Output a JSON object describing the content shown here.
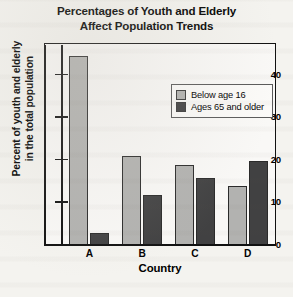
{
  "chart_data": {
    "type": "bar",
    "title": "Percentages of Youth and Elderly Affect Population Trends",
    "title_lines": [
      "Percentages of Youth and Elderly",
      "Affect Population Trends"
    ],
    "xlabel": "Country",
    "ylabel": "Percent of youth and elderly in the total population",
    "ylabel_lines": [
      "Percent of youth and elderly",
      "in the total population"
    ],
    "categories": [
      "A",
      "B",
      "C",
      "D"
    ],
    "ylim": [
      0,
      47
    ],
    "yticks": [
      0,
      10,
      20,
      30,
      40
    ],
    "ytick_labels": [
      "0",
      "10",
      "20",
      "30",
      "40"
    ],
    "grid": false,
    "legend_position": "upper right",
    "series": [
      {
        "name": "Below age 16",
        "color": "#b2b2b0",
        "values": [
          44.5,
          20.8,
          18.7,
          13.7
        ]
      },
      {
        "name": "Ages 65 and older",
        "color": "#414142",
        "values": [
          2.8,
          11.6,
          15.8,
          19.7
        ]
      }
    ]
  },
  "legend": {
    "items": [
      {
        "label": "Below age 16"
      },
      {
        "label": "Ages 65 and older"
      }
    ]
  },
  "colors": {
    "light_bar": "#b2b2b0",
    "dark_bar": "#414142",
    "axis": "#111111",
    "plot_background": "#f9f8f6",
    "page_background": "#f4f3ef"
  }
}
